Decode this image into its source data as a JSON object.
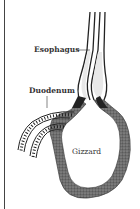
{
  "diagram": {
    "labels": {
      "esophagus": "Esophagus",
      "duodenum": "Duodenum",
      "gizzard": "Gizzard"
    },
    "colors": {
      "outline": "#222222",
      "muscle_wall": "#5a5a5a",
      "lumen": "#e8e8e8",
      "border": "#444444"
    }
  }
}
